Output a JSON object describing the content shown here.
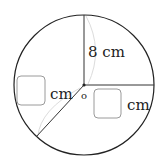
{
  "diagram": {
    "type": "circle-radii",
    "labels": {
      "top_radius": "8 cm",
      "left_unit": "cm",
      "right_unit": "cm",
      "center": "o"
    },
    "blanks": [
      {
        "id": "left-answer-box",
        "value": ""
      },
      {
        "id": "right-answer-box",
        "value": ""
      }
    ],
    "colors": {
      "stroke": "#222222",
      "faint_arc": "#d8d8d8",
      "box_border": "#9a9a9a"
    }
  }
}
